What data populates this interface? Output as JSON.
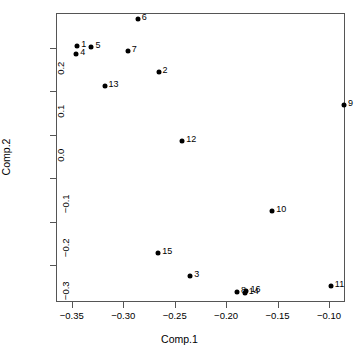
{
  "chart_data": {
    "type": "scatter",
    "title": "",
    "xlabel": "Comp.1",
    "ylabel": "Comp.2",
    "xlim": [
      -0.3653,
      -0.0845
    ],
    "ylim": [
      -0.3855,
      0.2805
    ],
    "grid": false,
    "legend": "none",
    "xticks": [
      -0.35,
      -0.3,
      -0.25,
      -0.2,
      -0.15,
      -0.1
    ],
    "xticklabels": [
      "-0.35",
      "-0.30",
      "-0.25",
      "-0.20",
      "-0.15",
      "-0.10"
    ],
    "yticks": [
      -0.3,
      -0.2,
      -0.1,
      0.0,
      0.1,
      0.2
    ],
    "yticklabels": [
      "-0.3",
      "-0.2",
      "-0.1",
      "0.0",
      "0.1",
      "0.2"
    ],
    "point_color": "#000000",
    "points": [
      {
        "label": "1",
        "x": -0.3447,
        "y": 0.2055
      },
      {
        "label": "2",
        "x": -0.2656,
        "y": 0.1443
      },
      {
        "label": "3",
        "x": -0.2348,
        "y": -0.3262
      },
      {
        "label": "4",
        "x": -0.3457,
        "y": 0.185
      },
      {
        "label": "5",
        "x": -0.3309,
        "y": 0.201
      },
      {
        "label": "6",
        "x": -0.2859,
        "y": 0.2673
      },
      {
        "label": "7",
        "x": -0.2955,
        "y": 0.192
      },
      {
        "label": "8",
        "x": -0.1894,
        "y": -0.3626
      },
      {
        "label": "9",
        "x": -0.0855,
        "y": 0.0693
      },
      {
        "label": "10",
        "x": -0.1553,
        "y": -0.1762
      },
      {
        "label": "11",
        "x": -0.0983,
        "y": -0.3489
      },
      {
        "label": "12",
        "x": -0.2427,
        "y": -0.0156
      },
      {
        "label": "13",
        "x": -0.3181,
        "y": 0.1124
      },
      {
        "label": "14",
        "x": -0.182,
        "y": -0.365
      },
      {
        "label": "15",
        "x": -0.266,
        "y": -0.2716
      },
      {
        "label": "16",
        "x": -0.1803,
        "y": -0.3603
      }
    ]
  }
}
